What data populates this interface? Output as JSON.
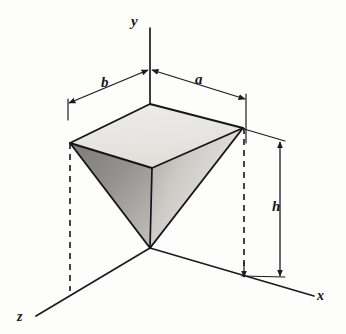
{
  "figure": {
    "background_color": "#fdfdfc",
    "line_color": "#1b1b20",
    "dash_color": "#3a3a40"
  },
  "axes": {
    "y": {
      "name": "y-axis",
      "label": "y",
      "from": [
        150,
        248
      ],
      "to": [
        150,
        28
      ],
      "label_pos": [
        131,
        14
      ]
    },
    "x": {
      "name": "x-axis",
      "label": "x",
      "from": [
        150,
        248
      ],
      "to": [
        314,
        296
      ],
      "label_pos": [
        317,
        289
      ]
    },
    "z": {
      "name": "z-axis",
      "label": "z",
      "from": [
        150,
        248
      ],
      "to": [
        36,
        316
      ],
      "label_pos": [
        17,
        310
      ]
    }
  },
  "dimensions": [
    {
      "name": "a",
      "label": "a",
      "description": "half-width along x from y-axis to right vertex",
      "from": [
        150,
        70
      ],
      "to": [
        246,
        98
      ],
      "label_pos": [
        195,
        72
      ]
    },
    {
      "name": "b",
      "label": "b",
      "description": "half-width along z from y-axis to left vertex",
      "from": [
        150,
        70
      ],
      "to": [
        68,
        103
      ],
      "label_pos": [
        101,
        75
      ]
    },
    {
      "name": "h",
      "label": "h",
      "description": "vertical height from apex to top face",
      "from": [
        280,
        141
      ],
      "to": [
        280,
        277
      ],
      "label_pos": [
        272,
        199
      ]
    }
  ],
  "solid": {
    "name": "inverted-pyramid",
    "apex": [
      150,
      248
    ],
    "top_face_vertices": {
      "back": [
        150,
        104
      ],
      "left": [
        70,
        143
      ],
      "front": [
        152,
        168
      ],
      "right": [
        243,
        128
      ]
    },
    "faces": [
      {
        "name": "top-face",
        "fill": "#e6e4e0",
        "vertices": [
          "back",
          "left",
          "front",
          "right"
        ]
      },
      {
        "name": "left-front-face",
        "fill": "#8f8d8c",
        "vertices": [
          "left",
          "front",
          "apex"
        ]
      },
      {
        "name": "right-front-face",
        "fill": "#d2d0cd",
        "vertices": [
          "front",
          "right",
          "apex"
        ]
      }
    ]
  },
  "projection_lines": [
    {
      "name": "left-vertex-projection",
      "from": [
        70,
        143
      ],
      "to": [
        70,
        290
      ]
    },
    {
      "name": "right-vertex-projection",
      "from": [
        244,
        128
      ],
      "to": [
        244,
        277
      ]
    },
    {
      "name": "center-axis-projection",
      "from": [
        150,
        104
      ],
      "to": [
        150,
        248
      ]
    }
  ],
  "extension_lines": [
    {
      "name": "left-dim-extension",
      "from": [
        68,
        100
      ],
      "to": [
        68,
        118
      ]
    },
    {
      "name": "right-dim-extension",
      "from": [
        246,
        95
      ],
      "to": [
        246,
        142
      ]
    },
    {
      "name": "h-top-extension",
      "from": [
        246,
        130
      ],
      "to": [
        284,
        141
      ]
    },
    {
      "name": "h-bottom-extension",
      "from": [
        243,
        276
      ],
      "to": [
        284,
        277
      ]
    }
  ]
}
